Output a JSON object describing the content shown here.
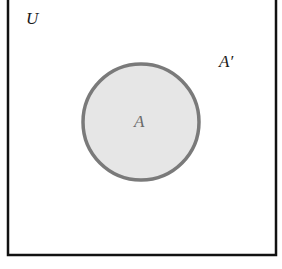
{
  "diagram": {
    "type": "venn",
    "universe": {
      "label": "U",
      "border_color": "#111111"
    },
    "set_a": {
      "label": "A",
      "fill_color": "#e6e6e6",
      "stroke_color": "#7a7a7a"
    },
    "complement": {
      "label": "A′"
    }
  }
}
